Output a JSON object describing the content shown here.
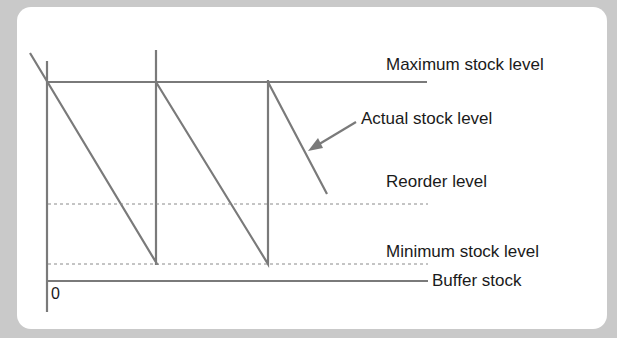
{
  "diagram": {
    "type": "inventory stock level sawtooth diagram",
    "labels": {
      "maximum": "Maximum stock level",
      "actual": "Actual stock level",
      "reorder": "Reorder level",
      "minimum": "Minimum stock level",
      "buffer": "Buffer stock",
      "origin": "0"
    },
    "colors": {
      "line": "#7a7a7a",
      "background": "#c9c9c9",
      "panel": "#ffffff",
      "text": "#1a1a1a"
    }
  }
}
